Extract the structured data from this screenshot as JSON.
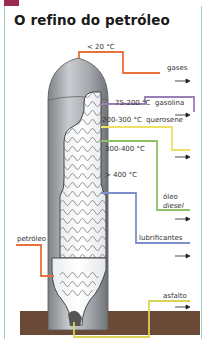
{
  "title": "O refino do petróleo",
  "accent_color": "#9b2a4e",
  "frame_color": "#9fd0cf",
  "input": {
    "label": "petróleo",
    "color": "#e8703a"
  },
  "bottom_temp": "> 400 °C",
  "fractions": [
    {
      "temp": "< 20 °C",
      "product": "gases",
      "color": "#e8703a"
    },
    {
      "temp": "75-200 °C",
      "product": "gasolina",
      "color": "#9a7fb6"
    },
    {
      "temp": "200-300 °C",
      "product": "querosene",
      "color": "#f0e060"
    },
    {
      "temp": "300-400 °C",
      "product_line1": "óleo",
      "product_line2": "diesel",
      "color": "#8cc265"
    },
    {
      "temp": "> 400 °C",
      "product": "lubrificantes",
      "color": "#7f8fcc"
    },
    {
      "temp": "",
      "product": "asfalto",
      "color": "#d8d650"
    }
  ],
  "ground_color": "#6a4a36"
}
